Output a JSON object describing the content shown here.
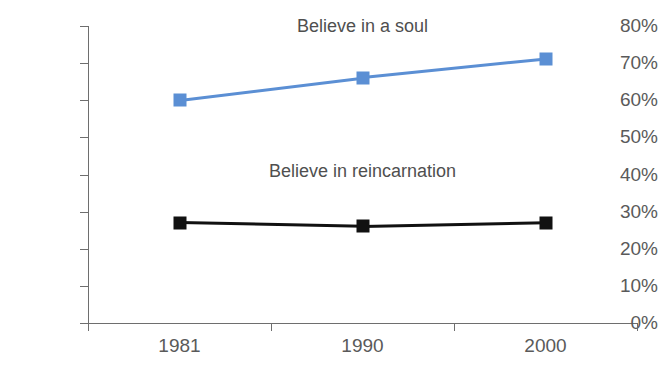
{
  "chart_data": {
    "type": "line",
    "title": "",
    "xlabel": "",
    "ylabel": "",
    "categories": [
      "1981",
      "1990",
      "2000"
    ],
    "ylim": [
      0,
      80
    ],
    "ytick_labels": [
      "0%",
      "10%",
      "20%",
      "30%",
      "40%",
      "50%",
      "60%",
      "70%",
      "80%"
    ],
    "ytick_values": [
      0,
      10,
      20,
      30,
      40,
      50,
      60,
      70,
      80
    ],
    "grid": false,
    "legend_position": "inline-annotation",
    "series": [
      {
        "name": "Believe in a soul",
        "color": "#5b8fd4",
        "marker": "square",
        "values": [
          60,
          66,
          71
        ]
      },
      {
        "name": "Believe in reincarnation",
        "color": "#111111",
        "marker": "square",
        "values": [
          27,
          26,
          27
        ]
      }
    ],
    "annotations": [
      {
        "text": "Believe in a soul",
        "x_category": "1990",
        "y_value": 80
      },
      {
        "text": "Believe in reincarnation",
        "x_category": "1990",
        "y_value": 41
      }
    ]
  }
}
